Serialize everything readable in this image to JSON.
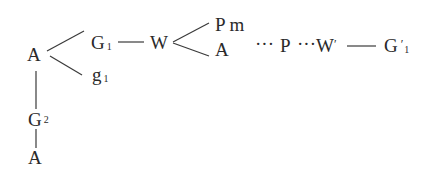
{
  "diagram": {
    "nodes": {
      "A_root": {
        "label": "A"
      },
      "G1": {
        "label": "G",
        "sub": "1"
      },
      "g1": {
        "label": "g",
        "sub": "1"
      },
      "W": {
        "label": "W"
      },
      "Pm": {
        "label": "P m"
      },
      "A_branch": {
        "label": "A"
      },
      "dots1": {
        "label": "···"
      },
      "P": {
        "label": "P"
      },
      "dots2": {
        "label": "···"
      },
      "Wprime": {
        "label": "W",
        "prime": "′"
      },
      "G1prime": {
        "label": "G",
        "prime": "′",
        "sub": "1"
      },
      "G2": {
        "label": "G",
        "sub": "2"
      },
      "A_bottom": {
        "label": "A"
      }
    },
    "edges": [
      {
        "from": "A_root",
        "to": "G1",
        "style": "solid"
      },
      {
        "from": "A_root",
        "to": "g1",
        "style": "solid"
      },
      {
        "from": "G1",
        "to": "W",
        "style": "solid"
      },
      {
        "from": "W",
        "to": "Pm",
        "style": "solid"
      },
      {
        "from": "W",
        "to": "A_branch",
        "style": "solid"
      },
      {
        "from": "Pm",
        "to": "P",
        "style": "dotted"
      },
      {
        "from": "P",
        "to": "Wprime",
        "style": "dotted"
      },
      {
        "from": "Wprime",
        "to": "G1prime",
        "style": "solid"
      },
      {
        "from": "A_root",
        "to": "G2",
        "style": "solid"
      },
      {
        "from": "G2",
        "to": "A_bottom",
        "style": "solid"
      }
    ]
  }
}
